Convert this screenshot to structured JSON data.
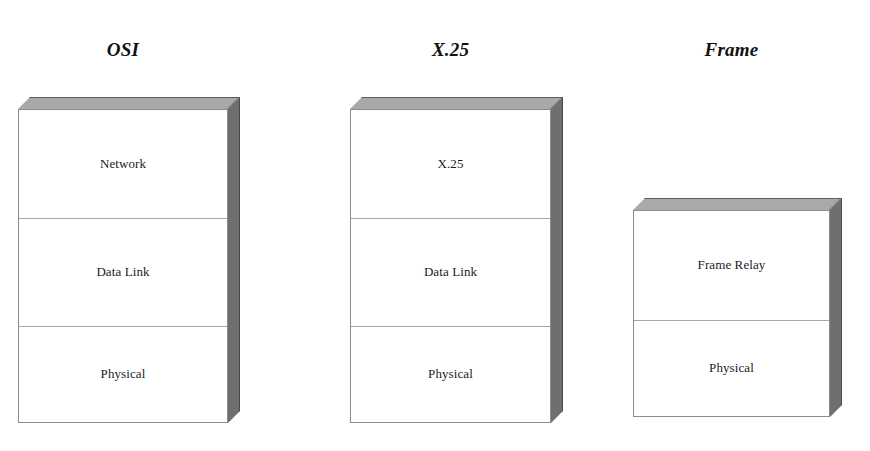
{
  "diagram": {
    "background_color": "#ffffff",
    "face_colors": {
      "front": "#ffffff",
      "top": "#a9a9a9",
      "right": "#6f6f6f",
      "outline": "#8c8c8c",
      "divider": "#a6a6a6"
    }
  },
  "stacks": [
    {
      "id": "osi",
      "title": "OSI",
      "layers": [
        {
          "label": "Network"
        },
        {
          "label": "Data Link"
        },
        {
          "label": "Physical"
        }
      ]
    },
    {
      "id": "x25",
      "title": "X.25",
      "layers": [
        {
          "label": "X.25"
        },
        {
          "label": "Data Link"
        },
        {
          "label": "Physical"
        }
      ]
    },
    {
      "id": "frame",
      "title": "Frame",
      "layers": [
        {
          "label": "Frame Relay"
        },
        {
          "label": "Physical"
        }
      ]
    }
  ]
}
